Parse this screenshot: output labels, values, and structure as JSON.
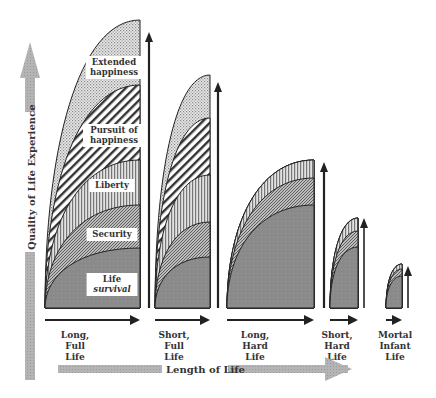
{
  "y_axis": {
    "label": "Quality of Life Experience"
  },
  "x_axis": {
    "label": "Length of Life"
  },
  "layers": [
    {
      "name": "Life survival",
      "label_lines": [
        "Life",
        "survival"
      ],
      "pattern": "solid"
    },
    {
      "name": "Security",
      "label_lines": [
        "Security"
      ],
      "pattern": "diag-fine"
    },
    {
      "name": "Liberty",
      "label_lines": [
        "Liberty"
      ],
      "pattern": "vertical"
    },
    {
      "name": "Pursuit of happiness",
      "label_lines": [
        "Pursuit of",
        "happiness"
      ],
      "pattern": "diag-bold"
    },
    {
      "name": "Extended happiness",
      "label_lines": [
        "Extended",
        "happiness"
      ],
      "pattern": "checker"
    }
  ],
  "chart_data": {
    "type": "area",
    "title": "",
    "xlabel": "Length of Life",
    "ylabel": "Quality of Life Experience",
    "categories": [
      "Long, Full Life",
      "Short, Full Life",
      "Long, Hard Life",
      "Short, Hard Life",
      "Mortal Infant Life"
    ],
    "category_labels": [
      [
        "Long,",
        "Full",
        "Life"
      ],
      [
        "Short,",
        "Full",
        "Life"
      ],
      [
        "Long,",
        "Hard",
        "Life"
      ],
      [
        "Short,",
        "Hard",
        "Life"
      ],
      [
        "Mortal",
        "Infant",
        "Life"
      ]
    ],
    "shapes": [
      {
        "x0": 45,
        "x1": 140,
        "base": 308,
        "layers_top": [
          248,
          205,
          160,
          85,
          20
        ],
        "arrow_x": 149,
        "arrow_top": 32
      },
      {
        "x0": 155,
        "x1": 210,
        "base": 308,
        "layers_top": [
          257,
          222,
          175,
          118,
          75
        ],
        "arrow_x": 218,
        "arrow_top": 82
      },
      {
        "x0": 227,
        "x1": 314,
        "base": 308,
        "layers_top": [
          205,
          178,
          160,
          160,
          160
        ],
        "arrow_x": 324,
        "arrow_top": 162
      },
      {
        "x0": 330,
        "x1": 358,
        "base": 308,
        "layers_top": [
          247,
          231,
          218,
          218,
          218
        ],
        "arrow_x": 364,
        "arrow_top": 218
      },
      {
        "x0": 386,
        "x1": 402,
        "base": 308,
        "layers_top": [
          276,
          269,
          264,
          264,
          264
        ],
        "arrow_x": 408,
        "arrow_top": 266
      }
    ],
    "legend": null,
    "grid": false
  }
}
